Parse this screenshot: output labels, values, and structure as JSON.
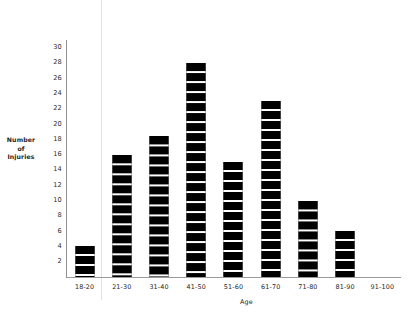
{
  "chart_data": {
    "type": "bar",
    "title": "",
    "xlabel": "Age",
    "ylabel": "Number of Injuries",
    "ylabel_lines": [
      "Number",
      "of",
      "Injuries"
    ],
    "categories": [
      "18-20",
      "21-30",
      "31-40",
      "41-50",
      "51-60",
      "61-70",
      "71-80",
      "81-90",
      "91-100"
    ],
    "values": [
      4,
      16,
      18.5,
      28,
      15,
      23,
      10,
      6,
      0
    ],
    "ylim": [
      0,
      31
    ],
    "yticks": [
      30,
      28,
      26,
      24,
      22,
      20,
      18,
      16,
      14,
      12,
      10,
      8,
      6,
      4,
      2
    ],
    "ytick_labels": [
      "30",
      "28",
      "26",
      "24",
      "22",
      "20",
      "18",
      "16",
      "14",
      "12",
      "10",
      "8",
      "6",
      "4",
      "2"
    ],
    "grid": false,
    "legend": false,
    "bar_color": "#000000",
    "bar_style": "segmented-stripes",
    "axis_color": "#8f8f8f",
    "background": "#ffffff"
  }
}
